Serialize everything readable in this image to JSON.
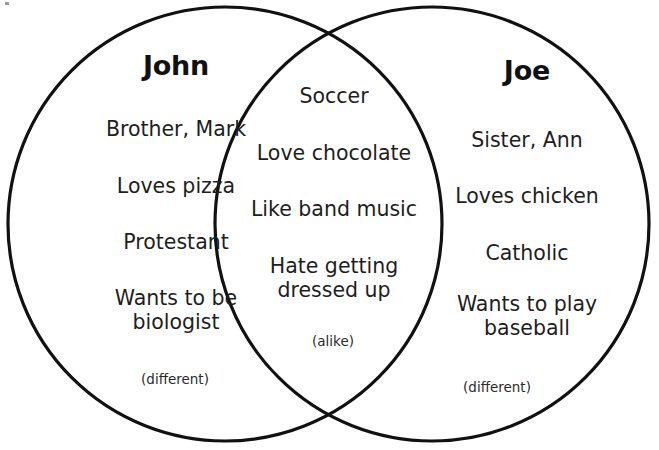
{
  "diagram": {
    "type": "venn",
    "stroke_color": "#111111",
    "background_color": "#ffffff",
    "left": {
      "heading": "John",
      "note": "(different)",
      "items": [
        "Brother, Mark",
        "Loves pizza",
        "Protestant",
        "Wants to be\nbiologist"
      ]
    },
    "center": {
      "heading": "",
      "note": "(alike)",
      "items": [
        "Soccer",
        "Love chocolate",
        "Like band music",
        "Hate getting\ndressed up"
      ]
    },
    "right": {
      "heading": "Joe",
      "note": "(different)",
      "items": [
        "Sister, Ann",
        "Loves chicken",
        "Catholic",
        "Wants to play\nbaseball"
      ]
    }
  }
}
